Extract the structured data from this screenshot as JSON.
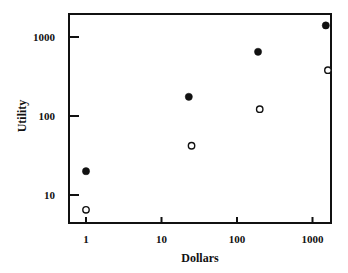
{
  "chart_data": {
    "type": "scatter",
    "title": "",
    "xlabel": "Dollars",
    "ylabel": "Utility",
    "xscale": "log",
    "yscale": "log",
    "xlim": [
      0.6,
      2200
    ],
    "ylim": [
      4.5,
      1900
    ],
    "grid": false,
    "legend": null,
    "x_ticks": [
      1,
      10,
      100,
      1000
    ],
    "x_tick_labels": [
      "1",
      "10",
      "100",
      "1000"
    ],
    "y_ticks": [
      10,
      100,
      1000
    ],
    "y_tick_labels": [
      "10",
      "100",
      "1000"
    ],
    "series": [
      {
        "name": "filled circles",
        "marker": "filled-circle",
        "color": "#111111",
        "points": [
          {
            "x": 1,
            "y": 20
          },
          {
            "x": 23,
            "y": 175
          },
          {
            "x": 190,
            "y": 650
          },
          {
            "x": 1500,
            "y": 1400
          }
        ]
      },
      {
        "name": "open circles",
        "marker": "open-circle",
        "color": "#111111",
        "points": [
          {
            "x": 1,
            "y": 6.5
          },
          {
            "x": 25,
            "y": 42
          },
          {
            "x": 200,
            "y": 122
          },
          {
            "x": 1600,
            "y": 380
          }
        ]
      }
    ]
  },
  "layout": {
    "frame": {
      "left": 69,
      "top": 14,
      "right": 331,
      "bottom": 223
    },
    "x_pixel_per_decade": 75.5,
    "x_origin_value": 1,
    "x_origin_pixel": 86,
    "y_pixel_per_decade": 79,
    "y_origin_value": 10,
    "y_origin_pixel": 195
  }
}
